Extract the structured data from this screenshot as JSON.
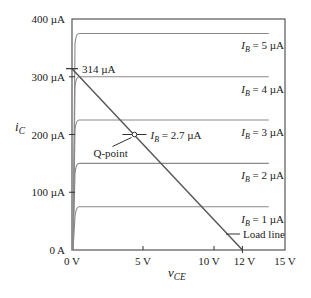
{
  "chart_data": {
    "type": "line",
    "title": "",
    "xlabel": "v_CE",
    "ylabel": "i_C",
    "xlim": [
      0,
      15
    ],
    "ylim": [
      0,
      400
    ],
    "x_unit": "V",
    "y_unit": "µA",
    "grid": false,
    "x_ticks": [
      {
        "value": 0,
        "label": "0 V"
      },
      {
        "value": 5,
        "label": "5 V"
      },
      {
        "value": 10,
        "label": "10 V"
      },
      {
        "value": 12,
        "label": "12 V"
      },
      {
        "value": 15,
        "label": "15 V"
      }
    ],
    "y_ticks": [
      {
        "value": 0,
        "label": "0 A"
      },
      {
        "value": 100,
        "label": "100 µA"
      },
      {
        "value": 200,
        "label": "200 µA"
      },
      {
        "value": 300,
        "label": "300 µA"
      },
      {
        "value": 400,
        "label": "400 µA"
      }
    ],
    "series": [
      {
        "name": "I_B = 1 µA",
        "label_main": "I",
        "label_sub": "B",
        "label_rest": " = 1 µA",
        "saturation_current": 75
      },
      {
        "name": "I_B = 2 µA",
        "label_main": "I",
        "label_sub": "B",
        "label_rest": " = 2 µA",
        "saturation_current": 150
      },
      {
        "name": "I_B = 3 µA",
        "label_main": "I",
        "label_sub": "B",
        "label_rest": " = 3 µA",
        "saturation_current": 225
      },
      {
        "name": "I_B = 4 µA",
        "label_main": "I",
        "label_sub": "B",
        "label_rest": " = 4 µA",
        "saturation_current": 300
      },
      {
        "name": "I_B = 5 µA",
        "label_main": "I",
        "label_sub": "B",
        "label_rest": " = 5 µA",
        "saturation_current": 375
      }
    ],
    "curve_x_end": 14,
    "load_line": {
      "label": "Load line",
      "points": [
        [
          0,
          314
        ],
        [
          12,
          0
        ]
      ],
      "intercept_label": "314 µA"
    },
    "q_point": {
      "label": "Q-point",
      "x": 4.4,
      "y": 200,
      "annotation_main": "I",
      "annotation_sub": "B",
      "annotation_rest": " = 2.7 µA"
    },
    "axis_labels": {
      "y_main": "i",
      "y_sub": "C",
      "x_main": "v",
      "x_sub": "CE"
    }
  }
}
